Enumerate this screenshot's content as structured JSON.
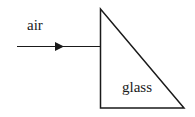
{
  "diagram": {
    "labels": {
      "medium_outside": "air",
      "medium_inside": "glass"
    },
    "shapes": {
      "prism": {
        "type": "right-triangle",
        "vertices": [
          [
            100,
            9
          ],
          [
            100,
            108
          ],
          [
            184,
            108
          ]
        ]
      },
      "incident_ray": {
        "from": [
          17,
          46
        ],
        "to": [
          100,
          46
        ],
        "arrow_at": [
          62,
          46
        ],
        "direction": "right"
      }
    },
    "colors": {
      "stroke": "#1a1a1a",
      "background": "#ffffff"
    }
  }
}
